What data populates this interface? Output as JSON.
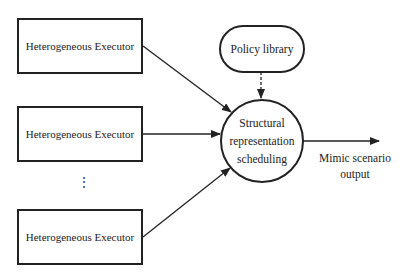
{
  "executors": [
    {
      "label": "Heterogeneous Executor"
    },
    {
      "label": "Heterogeneous Executor"
    },
    {
      "label": "Heterogeneous Executor"
    }
  ],
  "ellipsis": "⋮",
  "policy_library": {
    "label": "Policy library"
  },
  "scheduler": {
    "line1": "Structural",
    "line2": "representation",
    "line3": "scheduling"
  },
  "output": {
    "line1": "Mimic scenario",
    "line2": "output"
  }
}
